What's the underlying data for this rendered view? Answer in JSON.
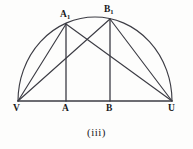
{
  "figure": {
    "caption": "(iii)",
    "stroke_color": "#3c3c44",
    "label_color": "#1a1a1a",
    "background_color": "#fdfdfc",
    "points": {
      "V": {
        "label": "V",
        "x": 18,
        "y": 101
      },
      "U": {
        "label": "U",
        "x": 172,
        "y": 101
      },
      "A": {
        "label": "A",
        "x": 66,
        "y": 101
      },
      "B": {
        "label": "B",
        "x": 110,
        "y": 101
      },
      "A1": {
        "label": "A",
        "sub": "1",
        "x": 66,
        "y": 24
      },
      "B1": {
        "label": "B",
        "sub": "1",
        "x": 110,
        "y": 19
      }
    },
    "arc": {
      "name": "semicircle-VU",
      "center_x": 95,
      "center_y": 101,
      "radius_x": 77,
      "radius_y": 84
    },
    "segments": [
      {
        "name": "baseline-VU",
        "from": "V",
        "to": "U"
      },
      {
        "name": "vertical-A-A1",
        "from": "A",
        "to": "A1"
      },
      {
        "name": "vertical-B-B1",
        "from": "B",
        "to": "B1"
      },
      {
        "name": "chord-V-A1",
        "from": "V",
        "to": "A1"
      },
      {
        "name": "chord-V-B1",
        "from": "V",
        "to": "B1"
      },
      {
        "name": "chord-A1-U",
        "from": "A1",
        "to": "U"
      },
      {
        "name": "chord-B1-U",
        "from": "B1",
        "to": "U"
      }
    ]
  }
}
